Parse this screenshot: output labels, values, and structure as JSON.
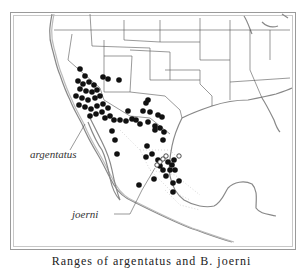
{
  "map": {
    "title": "Range map",
    "labels": {
      "argentatus": "argentatus",
      "joerni": "joerni"
    },
    "caption": "Ranges of argentatus and B. joerni",
    "legend": {
      "filled_dot": "argentatus locality",
      "open_dot": "joerni locality"
    },
    "colors": {
      "dot": "#111111",
      "border": "#555555",
      "coast": "#888888",
      "background": "#ffffff"
    }
  }
}
